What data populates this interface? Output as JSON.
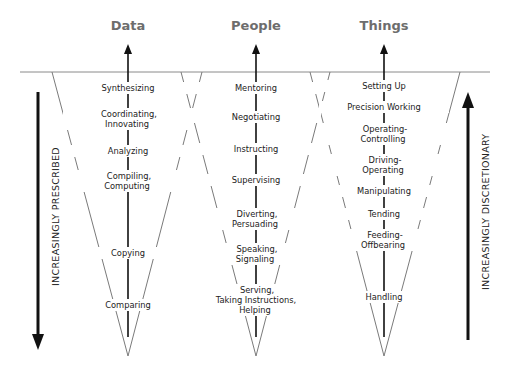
{
  "columns": [
    {
      "title": "Data",
      "levels": [
        "Synthesizing",
        "Coordinating,\nInnovating",
        "Analyzing",
        "Compiling,\nComputing",
        "Copying",
        "Comparing"
      ]
    },
    {
      "title": "People",
      "levels": [
        "Mentoring",
        "Negotiating",
        "Instructing",
        "Supervising",
        "Diverting,\nPersuading",
        "Speaking,\nSignaling",
        "Serving,\nTaking Instructions,\nHelping"
      ]
    },
    {
      "title": "Things",
      "levels": [
        "Setting Up",
        "Precision Working",
        "Operating-\nControlling",
        "Driving-\nOperating",
        "Manipulating",
        "Tending",
        "Feeding-\nOffbearing",
        "Handling"
      ]
    }
  ],
  "axes": {
    "left": {
      "label": "INCREASINGLY PRESCRIBED",
      "direction": "down"
    },
    "right": {
      "label": "INCREASINGLY DISCRETIONARY",
      "direction": "up"
    }
  },
  "colors": {
    "line": "#7a7a7a",
    "arrow": "#111111",
    "title": "#6d6d6d",
    "text": "#222222"
  }
}
